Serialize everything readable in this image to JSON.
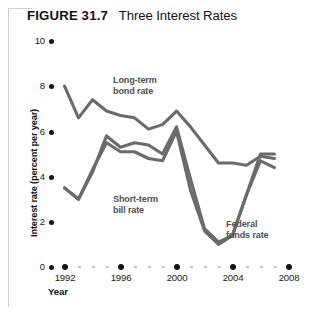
{
  "figure": {
    "label": "FIGURE",
    "number": "31.7",
    "title": "Three Interest Rates"
  },
  "axis": {
    "y_title": "Interest rate (percent per year)",
    "x_title": "Year"
  },
  "annotations": {
    "long_term": {
      "line1": "Long-term",
      "line2": "bond rate"
    },
    "short_term": {
      "line1": "Short-term",
      "line2": "bill rate"
    },
    "federal_funds": {
      "line1": "Federal",
      "line2": "funds rate"
    }
  },
  "colors": {
    "line": "#6b6b6b",
    "text": "#1a1a1a",
    "annotation": "#4f4f4f",
    "frame": "#cfcfcf",
    "dot_major": "#141414",
    "dot_minor": "#b9b9b9"
  },
  "chart_data": {
    "type": "line",
    "title": "Three Interest Rates",
    "xlabel": "Year",
    "ylabel": "Interest rate (percent per year)",
    "xlim": [
      1992,
      2008
    ],
    "ylim": [
      0,
      10
    ],
    "yticks": [
      0,
      2,
      4,
      6,
      8,
      10
    ],
    "xticks": [
      1992,
      1996,
      2000,
      2004,
      2008
    ],
    "grid": false,
    "legend_position": "inline-annotations",
    "x": [
      1992,
      1993,
      1994,
      1995,
      1996,
      1997,
      1998,
      1999,
      2000,
      2001,
      2002,
      2003,
      2004,
      2005,
      2006,
      2007
    ],
    "series": [
      {
        "name": "Long-term bond rate",
        "values": [
          8.0,
          6.6,
          7.4,
          6.9,
          6.7,
          6.6,
          6.1,
          6.3,
          6.9,
          6.2,
          5.4,
          4.6,
          4.6,
          4.5,
          4.9,
          4.8
        ]
      },
      {
        "name": "Short-term bill rate",
        "values": [
          3.5,
          3.0,
          4.3,
          5.5,
          5.1,
          5.1,
          4.8,
          4.7,
          6.0,
          3.4,
          1.6,
          1.0,
          1.4,
          3.2,
          4.7,
          4.4
        ]
      },
      {
        "name": "Federal funds rate",
        "values": [
          3.5,
          3.0,
          4.2,
          5.8,
          5.3,
          5.5,
          5.4,
          5.0,
          6.2,
          3.9,
          1.7,
          1.1,
          1.4,
          3.2,
          5.0,
          5.0
        ]
      }
    ]
  }
}
